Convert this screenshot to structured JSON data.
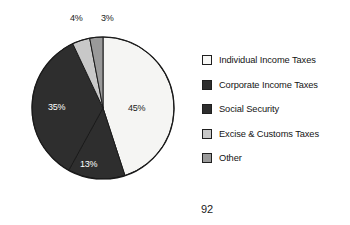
{
  "chart_data": {
    "type": "pie",
    "title": "",
    "legend_position": "right",
    "categories": [
      "Individual Income Taxes",
      "Corporate Income Taxes",
      "Social Security",
      "Excise & Customs Taxes",
      "Other"
    ],
    "values": [
      45,
      13,
      35,
      4,
      3
    ],
    "value_labels": [
      "45%",
      "13%",
      "35%",
      "4%",
      "3%"
    ],
    "colors": [
      "#f5f5f3",
      "#2e2e2e",
      "#2e2e2e",
      "#c8c8c8",
      "#9a9a9a"
    ],
    "slice_order_clockwise_from_top": [
      "Individual Income Taxes",
      "Corporate Income Taxes",
      "Social Security",
      "Excise & Customs Taxes",
      "Other"
    ],
    "start_angle_deg": 0,
    "direction": "clockwise",
    "outline_color": "#1a1a1a"
  },
  "pie": {
    "center_x": 103,
    "center_y": 108,
    "radius": 71,
    "slices": [
      {
        "name": "Individual Income Taxes",
        "label": "45%",
        "value": 45,
        "color": "#f5f5f3",
        "label_x": 128,
        "label_y": 103,
        "label_on_dark": false
      },
      {
        "name": "Corporate Income Taxes",
        "label": "13%",
        "value": 13,
        "color": "#2e2e2e",
        "label_x": 80,
        "label_y": 159,
        "label_on_dark": true
      },
      {
        "name": "Social Security",
        "label": "35%",
        "value": 35,
        "color": "#2e2e2e",
        "label_x": 48,
        "label_y": 102,
        "label_on_dark": true
      },
      {
        "name": "Excise & Customs Taxes",
        "label": "4%",
        "value": 4,
        "color": "#c8c8c8",
        "label_x": 70,
        "label_y": 13,
        "label_on_dark": false
      },
      {
        "name": "Other",
        "label": "3%",
        "value": 3,
        "color": "#9a9a9a",
        "label_x": 101,
        "label_y": 13,
        "label_on_dark": false
      }
    ]
  },
  "legend": {
    "items": [
      {
        "label": "Individual Income Taxes",
        "color": "#f8f8f6",
        "swatch_name": "legend-swatch-individual-income-taxes"
      },
      {
        "label": "Corporate Income Taxes",
        "color": "#2e2e2e",
        "swatch_name": "legend-swatch-corporate-income-taxes"
      },
      {
        "label": "Social Security",
        "color": "#2e2e2e",
        "swatch_name": "legend-swatch-social-security"
      },
      {
        "label": "Excise & Customs Taxes",
        "color": "#c8c8c8",
        "swatch_name": "legend-swatch-excise-customs-taxes"
      },
      {
        "label": "Other",
        "color": "#9a9a9a",
        "swatch_name": "legend-swatch-other"
      }
    ]
  },
  "footer": {
    "page_number": "92"
  }
}
